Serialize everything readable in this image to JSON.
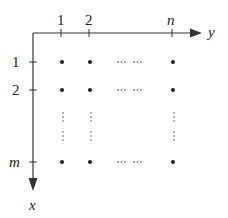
{
  "diagram": {
    "type": "matrix-grid-coordinate-diagram",
    "axes": {
      "horizontal": {
        "label": "y",
        "direction": "right"
      },
      "vertical": {
        "label": "x",
        "direction": "down"
      }
    },
    "column_ticks": [
      "1",
      "2",
      "n"
    ],
    "row_ticks": [
      "1",
      "2",
      "m"
    ],
    "rows": [
      {
        "label": "1",
        "points": [
          "dot",
          "dot",
          "ellipsis",
          "dot"
        ]
      },
      {
        "label": "2",
        "points": [
          "dot",
          "dot",
          "ellipsis",
          "dot"
        ]
      },
      {
        "label": "",
        "points": [
          "vdots",
          "vdots",
          "",
          "vdots"
        ]
      },
      {
        "label": "m",
        "points": [
          "dot",
          "dot",
          "ellipsis",
          "dot"
        ]
      }
    ],
    "horizontal_ellipsis": "··· ···",
    "colors": {
      "ink": "#222222",
      "background": "#ffffff"
    }
  }
}
